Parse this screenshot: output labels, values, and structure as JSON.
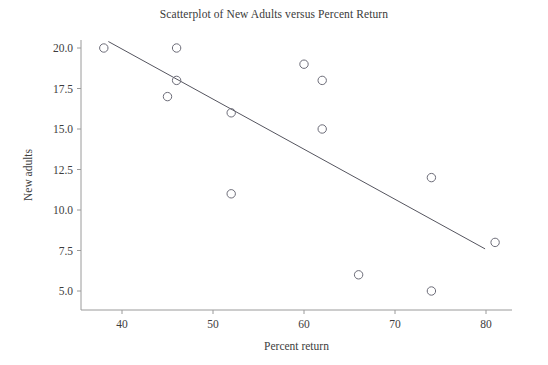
{
  "chart_data": {
    "type": "scatter",
    "title": "Scatterplot of New Adults versus Percent Return",
    "xlabel": "Percent return",
    "ylabel": "New adults",
    "xlim": [
      35,
      84
    ],
    "ylim": [
      3.8,
      21.2
    ],
    "xticks": [
      40,
      50,
      60,
      70,
      80
    ],
    "xtick_labels": [
      "40",
      "50",
      "60",
      "70",
      "80"
    ],
    "yticks": [
      5.0,
      7.5,
      10.0,
      12.5,
      15.0,
      17.5,
      20.0
    ],
    "ytick_labels": [
      "5.0",
      "7.5",
      "10.0",
      "12.5",
      "15.0",
      "17.5",
      "20.0"
    ],
    "grid": false,
    "legend": null,
    "marker": "open-circle",
    "points": [
      {
        "x": 38,
        "y": 20
      },
      {
        "x": 46,
        "y": 20
      },
      {
        "x": 46,
        "y": 18
      },
      {
        "x": 45,
        "y": 17
      },
      {
        "x": 52,
        "y": 16
      },
      {
        "x": 52,
        "y": 11
      },
      {
        "x": 60,
        "y": 19
      },
      {
        "x": 62,
        "y": 18
      },
      {
        "x": 62,
        "y": 15
      },
      {
        "x": 66,
        "y": 6
      },
      {
        "x": 74,
        "y": 12
      },
      {
        "x": 74,
        "y": 5
      },
      {
        "x": 81,
        "y": 8
      }
    ],
    "series": [
      {
        "name": "New adults",
        "x": [
          38,
          46,
          46,
          45,
          52,
          52,
          60,
          62,
          62,
          66,
          74,
          74,
          81
        ],
        "values": [
          20,
          20,
          18,
          17,
          16,
          11,
          19,
          18,
          15,
          6,
          12,
          5,
          8
        ]
      }
    ],
    "fit_line": {
      "type": "linear-regression",
      "x_start": 38.5,
      "y_start": 20.4,
      "x_end": 79.9,
      "y_end": 7.6
    }
  }
}
